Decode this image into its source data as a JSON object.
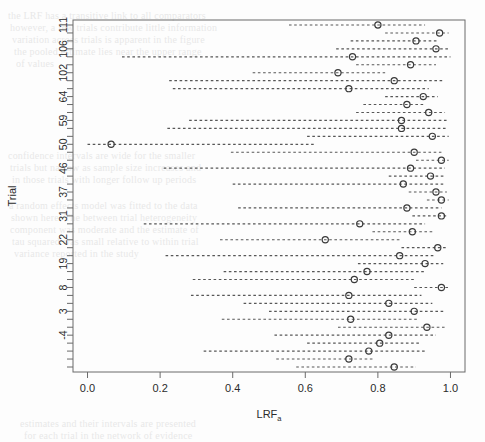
{
  "figure": {
    "kind": "forest-plot",
    "background": "#fdfdfd",
    "ink_color": "#575757",
    "marker_color": "#3a3a3a",
    "axis_color": "#6a6a6a"
  },
  "labels": {
    "xlabel_main": "LRF",
    "xlabel_sub": "a",
    "ylabel": "Trial"
  },
  "bleed_text": [
    {
      "t": "the  LRF  has  a  transitive  link  to  all  comparators",
      "x": 8,
      "y": 10,
      "size": 10
    },
    {
      "t": "however,  a  few  trials  contribute  little  information",
      "x": 10,
      "y": 22,
      "size": 10
    },
    {
      "t": "variation  across  trials  is  apparent  in  the  figure",
      "x": 12,
      "y": 34,
      "size": 10
    },
    {
      "t": "the  pooled  estimate  lies  near  the  upper  range",
      "x": 14,
      "y": 46,
      "size": 10
    },
    {
      "t": "of  values",
      "x": 16,
      "y": 58,
      "size": 10
    },
    {
      "t": "confidence  intervals  are  wide  for  the  smaller",
      "x": 8,
      "y": 150,
      "size": 10
    },
    {
      "t": "trials  but  narrow  as  sample  size  increases  and",
      "x": 10,
      "y": 162,
      "size": 10
    },
    {
      "t": "in  those  trials  with  longer  follow  up  periods",
      "x": 12,
      "y": 174,
      "size": 10
    },
    {
      "t": "a  random  effects  model  was  fitted  to  the  data",
      "x": 9,
      "y": 200,
      "size": 10
    },
    {
      "t": "shown  here.   The  between  trial  heterogeneity",
      "x": 11,
      "y": 212,
      "size": 10
    },
    {
      "t": "component  was  moderate  and  the  estimate  of",
      "x": 10,
      "y": 224,
      "size": 10
    },
    {
      "t": "tau  squared  was  small  relative  to  within  trial",
      "x": 12,
      "y": 236,
      "size": 10
    },
    {
      "t": "variance  reported  in  the  study",
      "x": 14,
      "y": 248,
      "size": 10
    },
    {
      "t": "estimates  and  their  intervals  are  presented",
      "x": 20,
      "y": 418,
      "size": 10
    },
    {
      "t": "for  each  trial  in  the  network  of  evidence",
      "x": 24,
      "y": 430,
      "size": 10
    }
  ],
  "chart_data": {
    "type": "scatter",
    "title": "",
    "xlabel": "LRFa",
    "ylabel": "Trial",
    "xlim": [
      -0.04,
      1.04
    ],
    "xticks": [
      0.0,
      0.2,
      0.4,
      0.6,
      0.8,
      1.0
    ],
    "xticklabels": [
      "0.0",
      "0.2",
      "0.4",
      "0.6",
      "0.8",
      "1.0"
    ],
    "grid": false,
    "legend": null,
    "ytick_labels_shown": [
      "111",
      "106",
      "102",
      "64",
      "59",
      "50",
      "46",
      "37",
      "31",
      "22",
      "19",
      "8",
      "3",
      "-4"
    ],
    "ytick_label_rows": [
      0,
      3,
      6,
      9,
      12,
      15,
      18,
      21,
      24,
      27,
      30,
      33,
      36,
      39
    ],
    "n_rows": 40,
    "note": "Each row is one trial: open circle = point estimate of LRFa, dashed segment = confidence interval. Rows listed top (row 0) to bottom (row 39).",
    "rows": [
      {
        "row": 0,
        "trial": "111",
        "estimate": 0.8,
        "ci_low": 0.555,
        "ci_high": 0.93
      },
      {
        "row": 1,
        "trial": "",
        "estimate": 0.97,
        "ci_low": 0.82,
        "ci_high": 0.995
      },
      {
        "row": 2,
        "trial": "",
        "estimate": 0.905,
        "ci_low": 0.725,
        "ci_high": 0.965
      },
      {
        "row": 3,
        "trial": "106",
        "estimate": 0.96,
        "ci_low": 0.685,
        "ci_high": 0.995
      },
      {
        "row": 4,
        "trial": "",
        "estimate": 0.73,
        "ci_low": 0.095,
        "ci_high": 1.0
      },
      {
        "row": 5,
        "trial": "",
        "estimate": 0.89,
        "ci_low": 0.74,
        "ci_high": 0.96
      },
      {
        "row": 6,
        "trial": "102",
        "estimate": 0.69,
        "ci_low": 0.455,
        "ci_high": 0.82
      },
      {
        "row": 7,
        "trial": "",
        "estimate": 0.845,
        "ci_low": 0.225,
        "ci_high": 0.98
      },
      {
        "row": 8,
        "trial": "",
        "estimate": 0.72,
        "ci_low": 0.235,
        "ci_high": 0.94
      },
      {
        "row": 9,
        "trial": "64",
        "estimate": 0.925,
        "ci_low": 0.82,
        "ci_high": 0.965
      },
      {
        "row": 10,
        "trial": "",
        "estimate": 0.88,
        "ci_low": 0.76,
        "ci_high": 0.93
      },
      {
        "row": 11,
        "trial": "",
        "estimate": 0.94,
        "ci_low": 0.74,
        "ci_high": 0.985
      },
      {
        "row": 12,
        "trial": "59",
        "estimate": 0.865,
        "ci_low": 0.28,
        "ci_high": 0.99
      },
      {
        "row": 13,
        "trial": "",
        "estimate": 0.865,
        "ci_low": 0.22,
        "ci_high": 0.99
      },
      {
        "row": 14,
        "trial": "",
        "estimate": 0.95,
        "ci_low": 0.605,
        "ci_high": 0.995
      },
      {
        "row": 15,
        "trial": "50",
        "estimate": 0.065,
        "ci_low": 0.0,
        "ci_high": 0.625
      },
      {
        "row": 16,
        "trial": "",
        "estimate": 0.9,
        "ci_low": 0.395,
        "ci_high": 0.975
      },
      {
        "row": 17,
        "trial": "",
        "estimate": 0.975,
        "ci_low": 0.905,
        "ci_high": 0.995
      },
      {
        "row": 18,
        "trial": "46",
        "estimate": 0.89,
        "ci_low": 0.21,
        "ci_high": 0.985
      },
      {
        "row": 19,
        "trial": "",
        "estimate": 0.945,
        "ci_low": 0.83,
        "ci_high": 0.985
      },
      {
        "row": 20,
        "trial": "",
        "estimate": 0.87,
        "ci_low": 0.4,
        "ci_high": 0.98
      },
      {
        "row": 21,
        "trial": "37",
        "estimate": 0.96,
        "ci_low": 0.885,
        "ci_high": 0.99
      },
      {
        "row": 22,
        "trial": "",
        "estimate": 0.975,
        "ci_low": 0.935,
        "ci_high": 0.995
      },
      {
        "row": 23,
        "trial": "",
        "estimate": 0.88,
        "ci_low": 0.415,
        "ci_high": 0.975
      },
      {
        "row": 24,
        "trial": "31",
        "estimate": 0.975,
        "ci_low": 0.895,
        "ci_high": 0.995
      },
      {
        "row": 25,
        "trial": "",
        "estimate": 0.75,
        "ci_low": 0.155,
        "ci_high": 0.93
      },
      {
        "row": 26,
        "trial": "",
        "estimate": 0.895,
        "ci_low": 0.785,
        "ci_high": 0.95
      },
      {
        "row": 27,
        "trial": "22",
        "estimate": 0.655,
        "ci_low": 0.365,
        "ci_high": 0.865
      },
      {
        "row": 28,
        "trial": "",
        "estimate": 0.965,
        "ci_low": 0.865,
        "ci_high": 0.99
      },
      {
        "row": 29,
        "trial": "",
        "estimate": 0.86,
        "ci_low": 0.215,
        "ci_high": 0.96
      },
      {
        "row": 30,
        "trial": "19",
        "estimate": 0.93,
        "ci_low": 0.745,
        "ci_high": 0.98
      },
      {
        "row": 31,
        "trial": "",
        "estimate": 0.77,
        "ci_low": 0.375,
        "ci_high": 0.93
      },
      {
        "row": 32,
        "trial": "",
        "estimate": 0.735,
        "ci_low": 0.29,
        "ci_high": 0.905
      },
      {
        "row": 33,
        "trial": "8",
        "estimate": 0.975,
        "ci_low": 0.9,
        "ci_high": 0.995
      },
      {
        "row": 34,
        "trial": "",
        "estimate": 0.72,
        "ci_low": 0.285,
        "ci_high": 0.92
      },
      {
        "row": 35,
        "trial": "",
        "estimate": 0.83,
        "ci_low": 0.43,
        "ci_high": 0.95
      },
      {
        "row": 36,
        "trial": "3",
        "estimate": 0.9,
        "ci_low": 0.5,
        "ci_high": 0.98
      },
      {
        "row": 37,
        "trial": "",
        "estimate": 0.725,
        "ci_low": 0.37,
        "ci_high": 0.91
      },
      {
        "row": 38,
        "trial": "",
        "estimate": 0.935,
        "ci_low": 0.69,
        "ci_high": 0.985
      },
      {
        "row": 39,
        "trial": "-4",
        "estimate": 0.83,
        "ci_low": 0.515,
        "ci_high": 0.96
      }
    ],
    "extra_rows": [
      {
        "row": 40,
        "trial": "",
        "estimate": 0.805,
        "ci_low": 0.605,
        "ci_high": 0.92
      },
      {
        "row": 41,
        "trial": "",
        "estimate": 0.775,
        "ci_low": 0.32,
        "ci_high": 0.93
      },
      {
        "row": 42,
        "trial": "",
        "estimate": 0.72,
        "ci_low": 0.52,
        "ci_high": 0.79
      },
      {
        "row": 43,
        "trial": "",
        "estimate": 0.845,
        "ci_low": 0.575,
        "ci_high": 0.905
      }
    ]
  }
}
